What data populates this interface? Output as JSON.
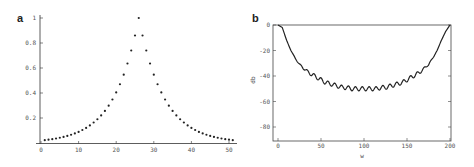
{
  "chart_data": [
    {
      "panel": "a",
      "type": "scatter",
      "title": "",
      "xlabel": "",
      "ylabel": "",
      "xlim": [
        0,
        52
      ],
      "ylim": [
        0,
        1
      ],
      "xticks": [
        0,
        10,
        20,
        30,
        40,
        50
      ],
      "yticks": [
        0.2,
        0.4,
        0.6,
        0.8,
        1
      ],
      "ytick_labels": [
        "0.2",
        "0.4",
        "0.6",
        "0.8",
        "1"
      ],
      "grid": false,
      "x": [
        1,
        2,
        3,
        4,
        5,
        6,
        7,
        8,
        9,
        10,
        11,
        12,
        13,
        14,
        15,
        16,
        17,
        18,
        19,
        20,
        21,
        22,
        23,
        24,
        25,
        26,
        27,
        28,
        29,
        30,
        31,
        32,
        33,
        34,
        35,
        36,
        37,
        38,
        39,
        40,
        41,
        42,
        43,
        44,
        45,
        46,
        47,
        48,
        49,
        50,
        51
      ],
      "values": [
        0.023,
        0.027,
        0.031,
        0.036,
        0.042,
        0.049,
        0.057,
        0.066,
        0.077,
        0.089,
        0.104,
        0.121,
        0.141,
        0.164,
        0.19,
        0.221,
        0.257,
        0.299,
        0.348,
        0.405,
        0.47,
        0.547,
        0.636,
        0.74,
        0.86,
        1.0,
        0.86,
        0.74,
        0.636,
        0.547,
        0.47,
        0.405,
        0.348,
        0.299,
        0.257,
        0.221,
        0.19,
        0.164,
        0.141,
        0.121,
        0.104,
        0.089,
        0.077,
        0.066,
        0.057,
        0.049,
        0.042,
        0.036,
        0.031,
        0.027,
        0.023
      ]
    },
    {
      "panel": "b",
      "type": "line",
      "title": "",
      "xlabel": "w",
      "ylabel": "db",
      "xlim": [
        0,
        200
      ],
      "ylim": [
        -90,
        0
      ],
      "xticks": [
        0,
        50,
        100,
        150,
        200
      ],
      "yticks": [
        0,
        -20,
        -40,
        -60,
        -80
      ],
      "ytick_labels": [
        "0",
        "-20",
        "-40",
        "-60",
        "-80"
      ],
      "grid": false,
      "x": [
        0,
        5,
        10,
        15,
        20,
        25,
        30,
        35,
        40,
        45,
        50,
        55,
        60,
        65,
        70,
        75,
        80,
        85,
        90,
        95,
        100,
        105,
        110,
        115,
        120,
        125,
        130,
        135,
        140,
        145,
        150,
        155,
        160,
        165,
        170,
        175,
        180,
        185,
        190,
        195,
        200
      ],
      "values": [
        0,
        -2,
        -12,
        -20,
        -26,
        -31,
        -34,
        -37,
        -39,
        -41,
        -43,
        -45,
        -46,
        -47,
        -48,
        -49,
        -49,
        -50,
        -50,
        -50,
        -50,
        -50,
        -50,
        -50,
        -49,
        -49,
        -48,
        -47,
        -46,
        -45,
        -43,
        -41,
        -39,
        -37,
        -34,
        -31,
        -26,
        -20,
        -12,
        -5,
        0
      ],
      "annotation": "small periodic ripple (~±1.5 dB, period ≈ 8) superimposed on the curve"
    }
  ],
  "panels": {
    "a": {
      "label": "a",
      "xtick_labels": [
        "0",
        "10",
        "20",
        "30",
        "40",
        "50"
      ],
      "ytick_labels": [
        "0.2",
        "0.4",
        "0.6",
        "0.8",
        "1"
      ]
    },
    "b": {
      "label": "b",
      "xlabel": "w",
      "ylabel": "db",
      "xtick_labels": [
        "0",
        "50",
        "100",
        "150",
        "200"
      ],
      "ytick_labels": [
        "0",
        "-20",
        "-40",
        "-60",
        "-80"
      ]
    }
  }
}
